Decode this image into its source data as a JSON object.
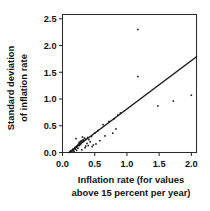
{
  "chart_data": {
    "type": "scatter",
    "title": "",
    "xlabel": "Inflation rate (for values above 15 percent per year)",
    "xlabel_lines": [
      "Inflation rate (for values",
      "above 15 percent per year)"
    ],
    "ylabel": "Standard deviation of inflation rate",
    "ylabel_lines": [
      "Standard deviation",
      "of inflation rate"
    ],
    "xlim": [
      0.0,
      2.08
    ],
    "ylim": [
      0.0,
      2.58
    ],
    "xticks": [
      0.0,
      0.5,
      1.0,
      1.5,
      2.0
    ],
    "xtick_labels": [
      "0.0",
      "0.5",
      "1.0",
      "1.5",
      "2.0"
    ],
    "yticks": [
      0.0,
      0.5,
      1.0,
      1.5,
      2.0,
      2.5
    ],
    "ytick_labels": [
      "0.0",
      "0.5",
      "1.0",
      "1.5",
      "2.0",
      "2.5"
    ],
    "grid": false,
    "legend": false,
    "legend_position": "none",
    "marker": "square",
    "marker_size": 1.6,
    "point_color": "#1a1a1a",
    "line_color": "#1a1a1a",
    "frame_color": "#2b2b2b",
    "fit_line": {
      "label": "fitted regression line",
      "x": [
        0.1,
        2.08
      ],
      "y": [
        0.0,
        1.79
      ],
      "slope": 0.904,
      "intercept": -0.09
    },
    "series": [
      {
        "name": "Countries",
        "points": [
          [
            0.12,
            0.02
          ],
          [
            0.13,
            0.03
          ],
          [
            0.14,
            0.01
          ],
          [
            0.15,
            0.04
          ],
          [
            0.16,
            0.03
          ],
          [
            0.16,
            0.06
          ],
          [
            0.17,
            0.05
          ],
          [
            0.18,
            0.07
          ],
          [
            0.18,
            0.02
          ],
          [
            0.19,
            0.08
          ],
          [
            0.2,
            0.06
          ],
          [
            0.2,
            0.1
          ],
          [
            0.21,
            0.09
          ],
          [
            0.21,
            0.26
          ],
          [
            0.22,
            0.12
          ],
          [
            0.22,
            0.04
          ],
          [
            0.23,
            0.11
          ],
          [
            0.24,
            0.14
          ],
          [
            0.24,
            0.08
          ],
          [
            0.25,
            0.16
          ],
          [
            0.26,
            0.13
          ],
          [
            0.26,
            0.19
          ],
          [
            0.27,
            0.17
          ],
          [
            0.28,
            0.15
          ],
          [
            0.28,
            0.21
          ],
          [
            0.29,
            0.19
          ],
          [
            0.3,
            0.22
          ],
          [
            0.3,
            0.05
          ],
          [
            0.31,
            0.2
          ],
          [
            0.31,
            0.29
          ],
          [
            0.32,
            0.24
          ],
          [
            0.33,
            0.23
          ],
          [
            0.34,
            0.27
          ],
          [
            0.35,
            0.09
          ],
          [
            0.36,
            0.25
          ],
          [
            0.36,
            0.12
          ],
          [
            0.38,
            0.17
          ],
          [
            0.39,
            0.28
          ],
          [
            0.4,
            0.13
          ],
          [
            0.41,
            0.24
          ],
          [
            0.43,
            0.2
          ],
          [
            0.45,
            0.3
          ],
          [
            0.46,
            0.11
          ],
          [
            0.48,
            0.14
          ],
          [
            0.5,
            0.36
          ],
          [
            0.52,
            0.16
          ],
          [
            0.55,
            0.41
          ],
          [
            0.58,
            0.22
          ],
          [
            0.63,
            0.52
          ],
          [
            0.66,
            0.31
          ],
          [
            0.72,
            0.58
          ],
          [
            0.78,
            0.36
          ],
          [
            0.8,
            0.63
          ],
          [
            0.83,
            0.44
          ],
          [
            0.86,
            0.7
          ],
          [
            0.9,
            0.74
          ],
          [
            1.17,
            2.3
          ],
          [
            1.17,
            1.42
          ],
          [
            1.48,
            0.87
          ],
          [
            1.72,
            0.96
          ],
          [
            2.0,
            1.07
          ]
        ]
      }
    ]
  }
}
